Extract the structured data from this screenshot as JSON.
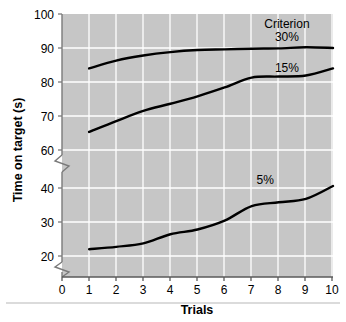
{
  "chart_data": {
    "type": "line",
    "title": "",
    "xlabel": "Trials",
    "ylabel": "Time on target (s)",
    "x": [
      1,
      2,
      3,
      4,
      5,
      6,
      7,
      8,
      9,
      10
    ],
    "xlim": [
      0,
      10.4
    ],
    "ylim": [
      20,
      100
    ],
    "y_axis_breaks": [
      "between 40 and 60",
      "below 20"
    ],
    "grid": true,
    "legend_position": "inline-right",
    "legend_title": "Criterion",
    "xticklabels": [
      "0",
      "1",
      "2",
      "3",
      "4",
      "5",
      "6",
      "7",
      "8",
      "9",
      "10"
    ],
    "yticklabels": [
      "20",
      "30",
      "40",
      "60",
      "70",
      "80",
      "90",
      "100"
    ],
    "series": [
      {
        "name": "30%",
        "label": "30%",
        "color": "#000000",
        "values": [
          84.0,
          86.3,
          87.8,
          88.8,
          89.4,
          89.6,
          89.8,
          89.9,
          90.2,
          90.0
        ]
      },
      {
        "name": "15%",
        "label": "15%",
        "color": "#000000",
        "values": [
          65.3,
          68.5,
          71.5,
          73.6,
          75.8,
          78.4,
          81.3,
          81.6,
          81.9,
          84.0
        ]
      },
      {
        "name": "5%",
        "label": "5%",
        "color": "#000000",
        "values": [
          22.0,
          22.7,
          23.7,
          26.4,
          27.8,
          30.4,
          34.7,
          35.8,
          36.8,
          40.6
        ]
      }
    ],
    "annotations": [
      {
        "text": "Criterion",
        "x": 8.3,
        "y": 97.0
      },
      {
        "text": "30%",
        "x": 8.3,
        "y": 93.2
      },
      {
        "text": "15%",
        "x": 8.3,
        "y": 84.2
      },
      {
        "text": "5%",
        "x": 7.5,
        "y": 42.5
      }
    ],
    "style": {
      "plot_background": "#c6c6c6",
      "grid_color": "#ffffff",
      "axis_color": "#7a7a7a",
      "line_color": "#1a1a1a",
      "line_width": 2.4,
      "page_background": "#ffffff",
      "footer_rule_color": "#b8b8b8"
    }
  },
  "axes": {
    "y_ticks_upper": [
      {
        "label": "100",
        "py": 14
      },
      {
        "label": "90",
        "py": 48
      },
      {
        "label": "80",
        "py": 82
      },
      {
        "label": "70",
        "py": 116
      },
      {
        "label": "60",
        "py": 150
      }
    ],
    "y_ticks_lower": [
      {
        "label": "40",
        "py": 188
      },
      {
        "label": "30",
        "py": 222
      },
      {
        "label": "20",
        "py": 256
      }
    ],
    "x_ticks": [
      {
        "label": "0",
        "px": 62
      },
      {
        "label": "1",
        "px": 89
      },
      {
        "label": "2",
        "px": 116
      },
      {
        "label": "3",
        "px": 143
      },
      {
        "label": "4",
        "px": 170
      },
      {
        "label": "5",
        "px": 197
      },
      {
        "label": "6",
        "px": 224
      },
      {
        "label": "7",
        "px": 251
      },
      {
        "label": "8",
        "px": 278
      },
      {
        "label": "9",
        "px": 305
      },
      {
        "label": "10",
        "px": 332
      }
    ]
  }
}
